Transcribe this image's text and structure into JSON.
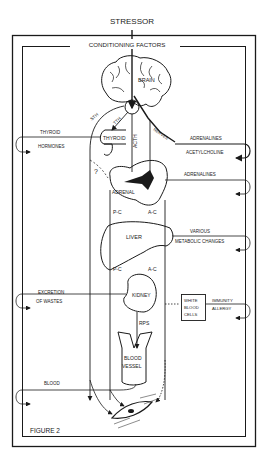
{
  "diagram": {
    "title": "STRESSOR",
    "frame_label": "CONDITIONING FACTORS",
    "figure_label": "FIGURE 2",
    "organs": {
      "brain": "BRAIN",
      "thyroid": "THYROID",
      "adrenal": "ADRENAL",
      "liver": "LIVER",
      "kidney": "KIDNEY",
      "white_blood_cells": [
        "WHITE",
        "BLOOD",
        "CELLS"
      ],
      "blood_vessel": [
        "BLOOD",
        "VESSEL"
      ]
    },
    "pathways": {
      "sth_outer": "STH",
      "tth": "TTH",
      "acth": "ACTH",
      "nerves": "NERVES",
      "pc_upper": "P-C",
      "ac_upper": "A-C",
      "pc_lower": "P-C",
      "ac_lower": "A-C",
      "rps": "RPS",
      "question": "?"
    },
    "outputs": {
      "thyroid_hormones": [
        "THYROID",
        "HORMONES"
      ],
      "adrenalines_acetylcholine": [
        "ADRENALINES",
        "ACETYLCHOLINE"
      ],
      "adrenalines": "ADRENALINES",
      "metabolic": [
        "VARIOUS",
        "METABOLIC CHANGES"
      ],
      "excretion": [
        "EXCRETION",
        "OF WASTES"
      ],
      "immunity": [
        "IMMUNITY",
        "ALLERGY"
      ],
      "blood": "BLOOD"
    }
  }
}
